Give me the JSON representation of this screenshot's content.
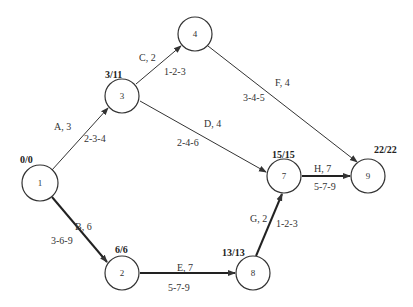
{
  "diagram": {
    "type": "activity-on-arrow network (PERT/CPM)",
    "nodes": [
      {
        "id": "1",
        "label": "1",
        "times": "0/0",
        "x": 40,
        "y": 183
      },
      {
        "id": "2",
        "label": "2",
        "times": "6/6",
        "x": 122,
        "y": 273
      },
      {
        "id": "3",
        "label": "3",
        "times": "3/11",
        "x": 122,
        "y": 96
      },
      {
        "id": "4",
        "label": "4",
        "times": "",
        "x": 195,
        "y": 34
      },
      {
        "id": "7",
        "label": "7",
        "times": "15/15",
        "x": 284,
        "y": 176
      },
      {
        "id": "8",
        "label": "8",
        "times": "13/13",
        "x": 253,
        "y": 273
      },
      {
        "id": "9",
        "label": "9",
        "times": "22/22",
        "x": 368,
        "y": 176
      }
    ],
    "edges": [
      {
        "from": "1",
        "to": "3",
        "activity": "A, 3",
        "estimates": "2-3-4",
        "critical": false
      },
      {
        "from": "1",
        "to": "2",
        "activity": "B, 6",
        "estimates": "3-6-9",
        "critical": true
      },
      {
        "from": "3",
        "to": "4",
        "activity": "C, 2",
        "estimates": "1-2-3",
        "critical": false
      },
      {
        "from": "3",
        "to": "7",
        "activity": "D, 4",
        "estimates": "2-4-6",
        "critical": false
      },
      {
        "from": "2",
        "to": "8",
        "activity": "E, 7",
        "estimates": "5-7-9",
        "critical": true
      },
      {
        "from": "4",
        "to": "9",
        "activity": "F, 4",
        "estimates": "3-4-5",
        "critical": false
      },
      {
        "from": "8",
        "to": "7",
        "activity": "G, 2",
        "estimates": "1-2-3",
        "critical": true
      },
      {
        "from": "7",
        "to": "9",
        "activity": "H, 7",
        "estimates": "5-7-9",
        "critical": true
      }
    ]
  },
  "colors": {
    "line": "#333333",
    "critical": "#222222",
    "background": "#ffffff"
  }
}
